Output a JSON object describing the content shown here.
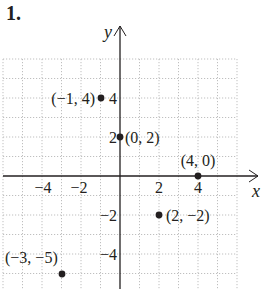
{
  "problem_number": "1.",
  "axes": {
    "x_label": "x",
    "y_label": "y",
    "x_ticks": [
      {
        "value": -4,
        "label": "−4"
      },
      {
        "value": -2,
        "label": "−2"
      },
      {
        "value": 2,
        "label": "2"
      },
      {
        "value": 4,
        "label": "4"
      }
    ],
    "y_ticks": [
      {
        "value": 4,
        "label": "4"
      },
      {
        "value": 2,
        "label": "2"
      },
      {
        "value": -2,
        "label": "−2"
      },
      {
        "value": -4,
        "label": "−4"
      }
    ],
    "grid": true,
    "xlim": [
      -6,
      6
    ],
    "ylim": [
      -6,
      6
    ]
  },
  "points": [
    {
      "x": -1,
      "y": 4,
      "label": "(−1, 4)"
    },
    {
      "x": 0,
      "y": 2,
      "label": "(0, 2)"
    },
    {
      "x": 4,
      "y": 0,
      "label": "(4, 0)"
    },
    {
      "x": 2,
      "y": -2,
      "label": "(2, −2)"
    },
    {
      "x": -3,
      "y": -5,
      "label": "(−3, −5)"
    }
  ],
  "colors": {
    "ink": "#231f20",
    "grid": "#b8b8b8"
  }
}
